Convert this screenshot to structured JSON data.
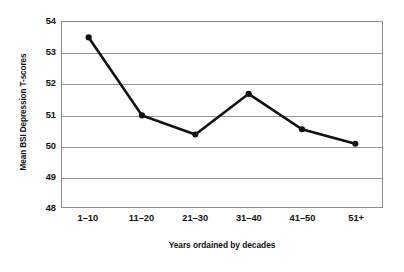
{
  "chart_data": {
    "type": "line",
    "title": "",
    "xlabel": "Years ordained by decades",
    "ylabel": "Mean BSI Depression T-scores",
    "categories": [
      "1–10",
      "11–20",
      "21–30",
      "31–40",
      "41–50",
      "51+"
    ],
    "values": [
      53.5,
      50.97,
      50.35,
      51.67,
      50.52,
      50.05
    ],
    "series": [
      {
        "name": "Mean BSI Depression T-scores",
        "values": [
          53.5,
          50.97,
          50.35,
          51.67,
          50.52,
          50.05
        ]
      }
    ],
    "ylim": [
      48,
      54
    ],
    "yticks": [
      48,
      49,
      50,
      51,
      52,
      53,
      54
    ],
    "ytick_labels": [
      "48",
      "49",
      "50",
      "51",
      "52",
      "53",
      "54"
    ],
    "grid": true,
    "grid_axis": "y",
    "legend": false,
    "legend_position": "none",
    "marker": "circle",
    "marker_filled": true,
    "line_color": "#111111",
    "marker_color": "#111111",
    "grid_color": "#949494",
    "frame_color": "#8d8d8d",
    "background_color": "#ffffff"
  }
}
